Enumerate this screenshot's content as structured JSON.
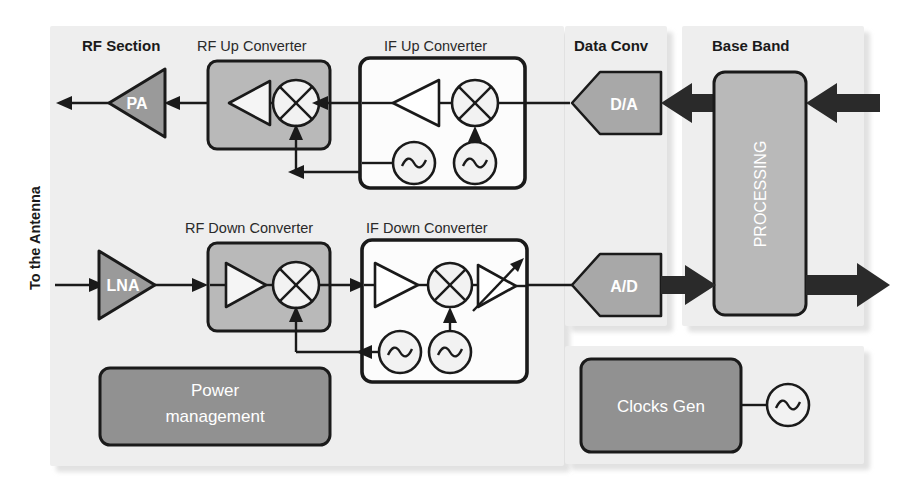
{
  "figure": {
    "kind": "rf-transceiver-block-diagram",
    "background": "#ffffff",
    "panel_fill": "#eeeeee",
    "block_fill_dark": "#919191",
    "block_fill_mid": "#b9b9b9",
    "line_color": "#1a1a1a"
  },
  "edge_labels": {
    "antenna": "To the Antenna"
  },
  "panels": [
    {
      "id": "rf",
      "title": "RF Section",
      "bold": true
    },
    {
      "id": "dataconv",
      "title": "Data Conv",
      "bold": true
    },
    {
      "id": "baseband",
      "title": "Base Band",
      "bold": true
    }
  ],
  "section_titles": {
    "rf_up": "RF Up Converter",
    "if_up": "IF Up Converter",
    "rf_down": "RF Down Converter",
    "if_down": "IF Down Converter"
  },
  "blocks": {
    "pa": {
      "label": "PA",
      "shape": "triangle-left",
      "fill": "#9a9a9a"
    },
    "lna": {
      "label": "LNA",
      "shape": "triangle-right",
      "fill": "#9a9a9a"
    },
    "da": {
      "label": "D/A",
      "shape": "pentagon-left",
      "fill": "#a8a8a8"
    },
    "ad": {
      "label": "A/D",
      "shape": "pentagon-left",
      "fill": "#a8a8a8"
    },
    "processing": {
      "label": "PROCESSING",
      "shape": "rounded-rect-vertical-text",
      "fill": "#b9b9b9"
    },
    "power_management": {
      "label_line1": "Power",
      "label_line2": "management",
      "shape": "rounded-rect",
      "fill": "#919191"
    },
    "clocks_gen": {
      "label": "Clocks Gen",
      "shape": "rounded-rect",
      "fill": "#919191"
    }
  },
  "symbols": {
    "amplifier": "amplifier-triangle",
    "mixer": "mixer-circle-cross",
    "oscillator": "oscillator-circle-sine",
    "vga": "variable-gain-amplifier-triangle-arrow",
    "signal_arrow": "thin-arrow",
    "bus_arrow": "thick-black-arrow"
  },
  "chains": {
    "transmit": [
      "Base Band PROCESSING",
      "D/A",
      "IF Up Converter",
      "RF Up Converter",
      "PA",
      "To the Antenna"
    ],
    "receive": [
      "From the Antenna",
      "LNA",
      "RF Down Converter",
      "IF Down Converter",
      "A/D",
      "Base Band PROCESSING"
    ]
  }
}
